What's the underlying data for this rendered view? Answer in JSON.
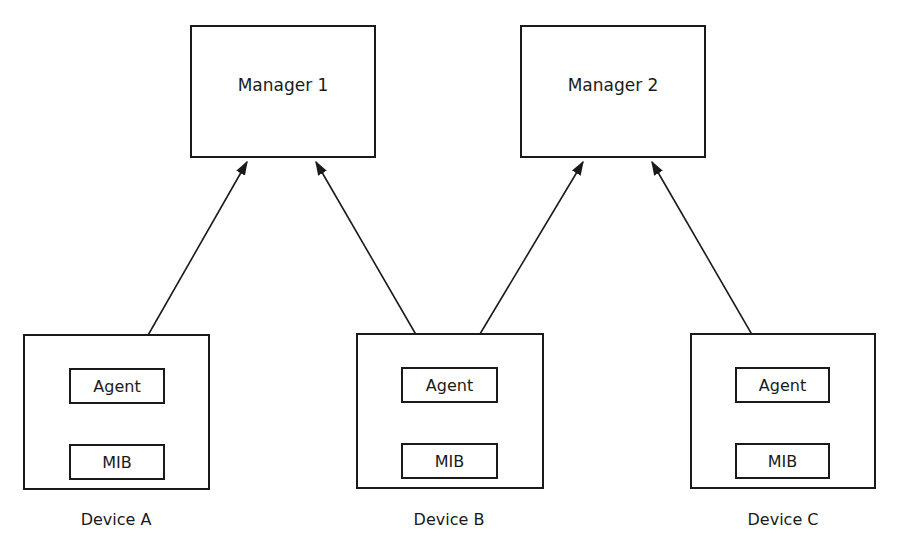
{
  "managers": [
    {
      "label": "Manager 1"
    },
    {
      "label": "Manager 2"
    }
  ],
  "devices": [
    {
      "label": "Device A",
      "agent": "Agent",
      "mib": "MIB"
    },
    {
      "label": "Device B",
      "agent": "Agent",
      "mib": "MIB"
    },
    {
      "label": "Device C",
      "agent": "Agent",
      "mib": "MIB"
    }
  ],
  "connections": [
    {
      "from": "Manager 1",
      "to": "Device A Agent",
      "type": "bidirectional"
    },
    {
      "from": "Manager 1",
      "to": "Device B Agent",
      "type": "bidirectional"
    },
    {
      "from": "Manager 2",
      "to": "Device B Agent",
      "type": "bidirectional"
    },
    {
      "from": "Manager 2",
      "to": "Device C Agent",
      "type": "bidirectional"
    },
    {
      "from": "Device A Agent",
      "to": "Device A MIB",
      "type": "bidirectional"
    },
    {
      "from": "Device B Agent",
      "to": "Device B MIB",
      "type": "bidirectional"
    },
    {
      "from": "Device C Agent",
      "to": "Device C MIB",
      "type": "bidirectional"
    }
  ],
  "colors": {
    "line": "#1a1a1a",
    "background": "#ffffff"
  }
}
